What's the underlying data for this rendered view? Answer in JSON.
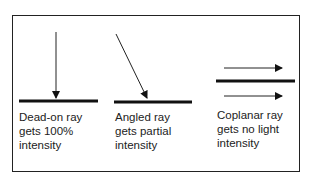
{
  "panels": [
    {
      "id": "dead-on",
      "caption": "Dead-on ray\ngets 100%\nintensity"
    },
    {
      "id": "angled",
      "caption": "Angled ray\ngets partial\nintensity"
    },
    {
      "id": "coplanar",
      "caption": "Coplanar ray\ngets no light\nintensity"
    }
  ],
  "colors": {
    "line": "#111111",
    "border": "#222222",
    "background": "#ffffff"
  }
}
